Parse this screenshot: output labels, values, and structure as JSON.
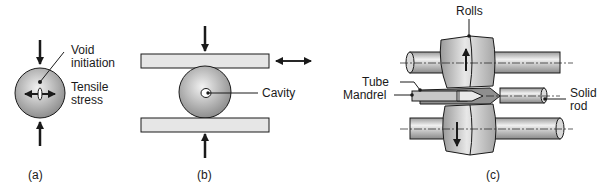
{
  "figure": {
    "panels": [
      {
        "caption": "(a)",
        "labels": {
          "void_initiation": [
            "Void",
            "initiation"
          ],
          "tensile_stress": [
            "Tensile",
            "stress"
          ]
        }
      },
      {
        "caption": "(b)",
        "labels": {
          "cavity": "Cavity"
        }
      },
      {
        "caption": "(c)",
        "labels": {
          "rolls": "Rolls",
          "tube": "Tube",
          "mandrel": "Mandrel",
          "solid_rod": [
            "Solid",
            "rod"
          ]
        }
      }
    ]
  },
  "colors": {
    "line": "#1a1a1a",
    "plate": "#e6e6e6",
    "metal": "#bdbdbd",
    "metal_dark": "#8f8f8f"
  }
}
